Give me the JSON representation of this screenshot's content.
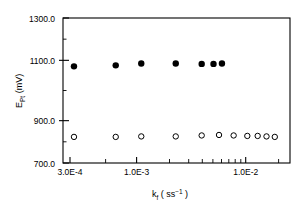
{
  "chart_data": {
    "type": "scatter",
    "title": "",
    "xlabel": "k_f ( s^-1 )",
    "ylabel": "E_Pt (mV)",
    "xscale": "log",
    "yscale": "linear",
    "xlim": [
      0.0003,
      0.013
    ],
    "ylim": [
      700.0,
      1300.0
    ],
    "grid": false,
    "legend": "none",
    "xticklabels": [
      "3.0E-4",
      "1.0E-3",
      "1.0E-2"
    ],
    "xtickvalues": [
      0.0003,
      0.001,
      0.01
    ],
    "yticklabels": [
      "700.0",
      "900.0",
      "1100.0",
      "1300.0"
    ],
    "ytickvalues": [
      700.0,
      900.0,
      1100.0,
      1300.0
    ],
    "series": [
      {
        "name": "filled-circles",
        "marker": "filled-circle",
        "color": "#000000",
        "x": [
          0.00036,
          0.00072,
          0.0011,
          0.00195,
          0.003,
          0.00365,
          0.0042
        ],
        "y": [
          1100,
          1104,
          1112,
          1112,
          1110,
          1110,
          1112
        ]
      },
      {
        "name": "open-circles",
        "marker": "open-circle",
        "color": "#000000",
        "x": [
          0.00036,
          0.00072,
          0.0011,
          0.00195,
          0.003,
          0.004,
          0.0051,
          0.0064,
          0.0076,
          0.0088,
          0.0101
        ],
        "y": [
          808,
          808,
          810,
          810,
          814,
          816,
          814,
          812,
          812,
          810,
          808
        ]
      }
    ]
  },
  "axis": {
    "y_title_main": "E",
    "y_title_sub": "Pt",
    "y_title_unit": " (mV)",
    "x_title_main": "k",
    "x_title_sub": "f",
    "x_title_open": " ( s",
    "x_title_sup": "−1",
    "x_title_close": " )"
  }
}
